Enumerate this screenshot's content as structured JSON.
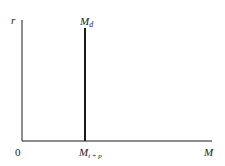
{
  "diagram": {
    "y_axis_label": "r",
    "x_axis_label": "M",
    "origin_label": "0",
    "curve_label_main": "M",
    "curve_label_sub": "d",
    "tick_label_main": "M",
    "tick_label_sub": "t + p",
    "colors": {
      "ink": "#1a1a1a",
      "background": "#ffffff"
    }
  }
}
